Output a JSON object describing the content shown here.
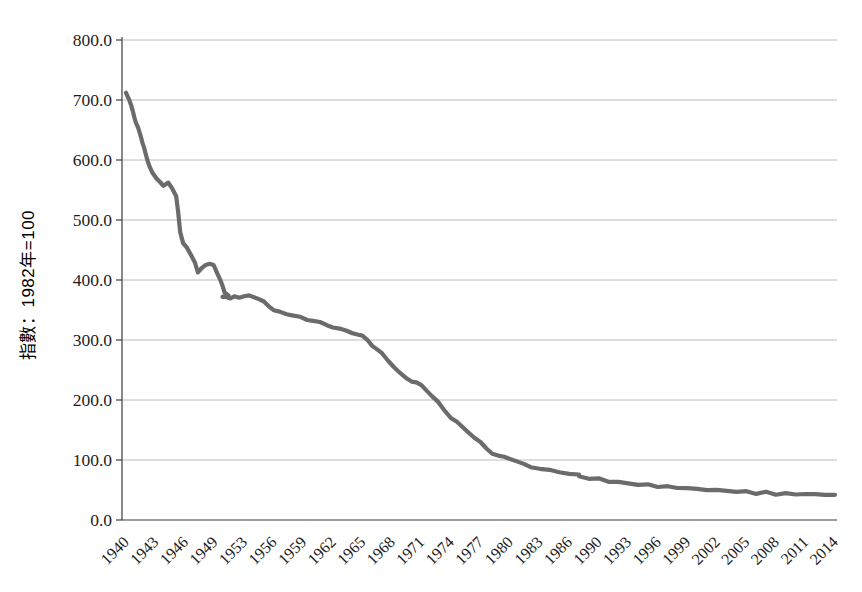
{
  "page": {
    "background_color": "#ffffff"
  },
  "style": {
    "line_color": "#6b6b6b",
    "grid_color": "#bcbcbc",
    "axis_color": "#3d3d3d",
    "text_color": "#1c1c1c"
  },
  "chart_data": {
    "type": "line",
    "title": "",
    "xlabel": "",
    "ylabel": "指數：1982年=100",
    "ylim": [
      0,
      800
    ],
    "yticks": [
      0,
      100,
      200,
      300,
      400,
      500,
      600,
      700,
      800
    ],
    "ytick_labels": [
      "0.0",
      "100.0",
      "200.0",
      "300.0",
      "400.0",
      "500.0",
      "600.0",
      "700.0",
      "800.0"
    ],
    "xtick_labels": [
      "1940",
      "1943",
      "1946",
      "1949",
      "1953",
      "1956",
      "1959",
      "1962",
      "1965",
      "1968",
      "1971",
      "1974",
      "1977",
      "1980",
      "1983",
      "1986",
      "1990",
      "1993",
      "1996",
      "1999",
      "2002",
      "2005",
      "2008",
      "2011",
      "2014"
    ],
    "x_range": [
      1940,
      2014
    ],
    "grid": "horizontal",
    "legend": "none",
    "series": [
      {
        "name": "index-line",
        "color": "#6b6b6b",
        "points": [
          [
            1940,
            712
          ],
          [
            1940.3,
            702
          ],
          [
            1940.7,
            681
          ],
          [
            1941,
            662
          ],
          [
            1941.5,
            640
          ],
          [
            1942,
            610
          ],
          [
            1942.4,
            590
          ],
          [
            1942.7,
            577
          ],
          [
            1943.1,
            569
          ],
          [
            1943.5,
            562
          ],
          [
            1943.8,
            558
          ],
          [
            1944.3,
            564
          ],
          [
            1944.7,
            551
          ],
          [
            1945.1,
            540
          ],
          [
            1945.3,
            512
          ],
          [
            1945.5,
            478
          ],
          [
            1945.8,
            463
          ],
          [
            1946.2,
            453
          ],
          [
            1946.6,
            443
          ],
          [
            1947,
            428
          ],
          [
            1947.3,
            413
          ],
          [
            1947.7,
            419
          ],
          [
            1948.1,
            426
          ],
          [
            1948.5,
            428
          ],
          [
            1948.9,
            424
          ],
          [
            1949.3,
            410
          ],
          [
            1949.6,
            398
          ],
          [
            1950,
            381
          ],
          [
            1950.4,
            374
          ],
          [
            1950.8,
            371
          ],
          [
            1951.2,
            373
          ],
          [
            1951.6,
            370
          ],
          [
            1952,
            372
          ],
          [
            1952.5,
            371
          ],
          [
            1953,
            373
          ],
          [
            1953.5,
            374
          ],
          [
            1954,
            372
          ],
          [
            1954.5,
            368
          ],
          [
            1955,
            363
          ],
          [
            1955.5,
            357
          ],
          [
            1956,
            351
          ],
          [
            1956.6,
            347
          ],
          [
            1957.3,
            344
          ],
          [
            1958,
            341
          ],
          [
            1958.7,
            338
          ],
          [
            1959.4,
            334
          ],
          [
            1960,
            331
          ],
          [
            1960.7,
            328
          ],
          [
            1961.4,
            324
          ],
          [
            1962,
            320
          ],
          [
            1962.7,
            317
          ],
          [
            1963.4,
            315
          ],
          [
            1964,
            312
          ],
          [
            1964.6,
            309
          ],
          [
            1965,
            306
          ],
          [
            1965.5,
            300
          ],
          [
            1966,
            292
          ],
          [
            1966.5,
            284
          ],
          [
            1967,
            276
          ],
          [
            1967.6,
            266
          ],
          [
            1968.2,
            256
          ],
          [
            1968.8,
            246
          ],
          [
            1969.4,
            238
          ],
          [
            1970,
            231
          ],
          [
            1970.5,
            228
          ],
          [
            1971,
            225
          ],
          [
            1971.6,
            216
          ],
          [
            1972.1,
            206
          ],
          [
            1972.7,
            195
          ],
          [
            1973.3,
            182
          ],
          [
            1974,
            170
          ],
          [
            1974.6,
            164
          ],
          [
            1975.2,
            155
          ],
          [
            1975.8,
            147
          ],
          [
            1976.4,
            137
          ],
          [
            1977,
            128
          ],
          [
            1977.6,
            118
          ],
          [
            1978.2,
            111
          ],
          [
            1978.8,
            108
          ],
          [
            1979.4,
            106
          ],
          [
            1980,
            103
          ],
          [
            1980.7,
            98
          ],
          [
            1981.4,
            93
          ],
          [
            1982.1,
            89
          ],
          [
            1983,
            86
          ],
          [
            1984,
            83
          ],
          [
            1985,
            80
          ],
          [
            1986,
            77
          ],
          [
            1987,
            75
          ],
          [
            1988,
            72
          ],
          [
            1989,
            70
          ],
          [
            1990,
            68
          ],
          [
            1991,
            65
          ],
          [
            1992,
            63
          ],
          [
            1993,
            61
          ],
          [
            1994,
            59.5
          ],
          [
            1995,
            58
          ],
          [
            1996,
            56.5
          ],
          [
            1997,
            55
          ],
          [
            1998,
            54
          ],
          [
            1999,
            53
          ],
          [
            2000,
            51.5
          ],
          [
            2001,
            50.5
          ],
          [
            2002,
            49.5
          ],
          [
            2003,
            48.5
          ],
          [
            2004,
            47.5
          ],
          [
            2005,
            46.5
          ],
          [
            2006,
            45.5
          ],
          [
            2007,
            45
          ],
          [
            2008,
            44
          ],
          [
            2009,
            43.5
          ],
          [
            2010,
            43
          ],
          [
            2011,
            43.5
          ],
          [
            2012,
            42.5
          ],
          [
            2013,
            42.5
          ],
          [
            2014,
            42
          ]
        ]
      }
    ]
  }
}
